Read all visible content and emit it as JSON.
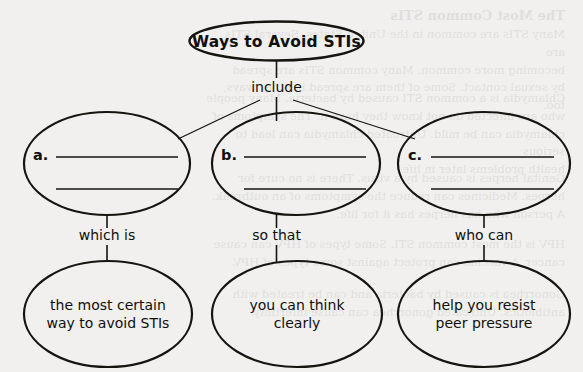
{
  "page": {
    "background_color": "#f1f0ee",
    "ink_color": "#15140f",
    "kind": "graphic-organizer-concept-map"
  },
  "diagram": {
    "title_node": {
      "label": "Ways to Avoid STIs"
    },
    "root_link_label": "include",
    "branch_nodes": [
      {
        "letter": "a.",
        "blank_lines": 2
      },
      {
        "letter": "b.",
        "blank_lines": 2
      },
      {
        "letter": "c.",
        "blank_lines": 2
      }
    ],
    "branch_link_labels": [
      "which is",
      "so that",
      "who can"
    ],
    "outcome_nodes": [
      {
        "line1": "the most certain",
        "line2": "way to avoid STIs"
      },
      {
        "line1": "you can think",
        "line2": "clearly"
      },
      {
        "line1": "help you resist",
        "line2": "peer pressure"
      }
    ]
  },
  "ghost_text": {
    "heading": "The Most Common STIs",
    "paragraphs": [
      "Many STIs are common in the United States. Several STIs are\nbecoming more common. Many common STIs are spread\nby sexual contact. Some of them are spread in other ways, too.",
      "Chlamydia is a common STI caused by bacteria. Many people\nwho are infected do not know they have it. The symptoms of\nchlamydia can be mild. Untreated chlamydia can lead to serious\nhealth problems later in life.",
      "Genital herpes is caused by a virus. There is no cure for\nherpes. Medicines can reduce the symptoms of an outbreak.\nA person who has herpes has it for life.",
      "HPV is the most common STI. Some types of HPV can cause\ncancer. A vaccine can protect against some types of HPV.",
      "Gonorrhea is caused by bacteria and can be treated with\nantibiotics. Untreated gonorrhea can cause infertility."
    ]
  }
}
